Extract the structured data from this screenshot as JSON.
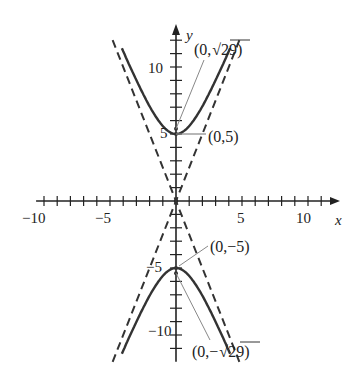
{
  "figure": {
    "type": "hyperbola graph",
    "equation_description": "Hyperbola with vertices (0,5) and (0,-5), foci (0,√29) and (0,-√29), dashed asymptotes y = ±(5/2)x",
    "a": 5,
    "b": 2,
    "asymptote_slope": 2.5,
    "axes": {
      "x_label": "x",
      "y_label": "y",
      "x_range": [
        -11,
        12
      ],
      "y_range": [
        -12,
        13
      ],
      "x_ticks": [
        "−10",
        "−5",
        "5",
        "10"
      ],
      "y_ticks": [
        "10",
        "5",
        "−5",
        "−10"
      ]
    },
    "annotations": [
      {
        "id": "focus-top",
        "text": "(0,",
        "sqrt": "29",
        "tail": ")"
      },
      {
        "id": "vertex-top",
        "text": "(0,5)"
      },
      {
        "id": "vertex-bottom",
        "text": "(0,−5)"
      },
      {
        "id": "focus-bottom",
        "text": "(0,−",
        "sqrt": "29",
        "tail": ")"
      }
    ],
    "colors": {
      "curve": "#333333",
      "asymptote": "#333333",
      "axis": "#222222",
      "leader": "#888888"
    }
  }
}
